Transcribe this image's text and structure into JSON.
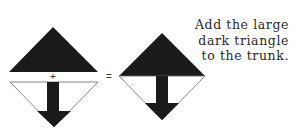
{
  "caption": {
    "lines": [
      "Add the large",
      "dark triangle",
      "to the trunk."
    ]
  },
  "operators": {
    "plus": "+",
    "equals": "="
  },
  "colors": {
    "dark": "#1a1a1a",
    "outline": "#555555",
    "background": "#ffffff"
  }
}
